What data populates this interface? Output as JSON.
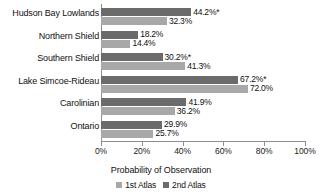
{
  "chart_data": {
    "type": "bar",
    "orientation": "horizontal",
    "title": "",
    "xlabel": "Probability of Observation",
    "ylabel": "",
    "xlim": [
      0,
      100
    ],
    "xticks": [
      "0%",
      "20%",
      "40%",
      "60%",
      "80%",
      "100%"
    ],
    "xtick_values": [
      0,
      20,
      40,
      60,
      80,
      100
    ],
    "grid": false,
    "legend_position": "bottom",
    "categories": [
      "Hudson Bay Lowlands",
      "Northern Shield",
      "Southern Shield",
      "Lake Simcoe-Rideau",
      "Carolinian",
      "Ontario"
    ],
    "series": [
      {
        "name": "1st Atlas",
        "color": "#a8a8a8",
        "values": [
          32.3,
          14.4,
          41.3,
          72.0,
          36.2,
          25.7
        ],
        "labels": [
          "32.3%",
          "14.4%",
          "41.3%",
          "72.0%",
          "36.2%",
          "25.7%"
        ]
      },
      {
        "name": "2nd Atlas",
        "color": "#6b6b6b",
        "values": [
          44.2,
          18.2,
          30.2,
          67.2,
          41.9,
          29.9
        ],
        "labels": [
          "44.2%*",
          "18.2%",
          "30.2%*",
          "67.2%*",
          "41.9%",
          "29.9%"
        ]
      }
    ],
    "annotations": {
      "asterisk_meaning": "*",
      "asterisked_categories": [
        "Hudson Bay Lowlands",
        "Southern Shield",
        "Lake Simcoe-Rideau"
      ]
    }
  },
  "legend": {
    "items": [
      {
        "label": "1st Atlas",
        "color": "#a8a8a8"
      },
      {
        "label": "2nd Atlas",
        "color": "#6b6b6b"
      }
    ]
  },
  "axis": {
    "x_title": "Probability of Observation"
  }
}
